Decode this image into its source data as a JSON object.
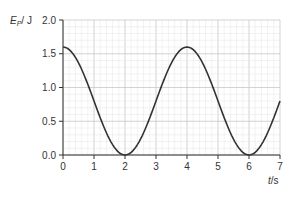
{
  "chart_data": {
    "type": "line",
    "title": "",
    "ylabel": "Ep/J",
    "ylabel_main": "E",
    "ylabel_sub": "P",
    "ylabel_unit": "/ J",
    "xlabel": "t/s",
    "xlabel_main": "t",
    "xlabel_unit": "/s",
    "xlim": [
      0,
      7
    ],
    "ylim": [
      0,
      2.0
    ],
    "grid": true,
    "x_ticks": [
      "0",
      "1",
      "2",
      "3",
      "4",
      "5",
      "6",
      "7"
    ],
    "y_ticks": [
      "0.0",
      "0.5",
      "1.0",
      "1.5",
      "2.0"
    ],
    "series": [
      {
        "name": "Ep",
        "color": "#333333",
        "x": [
          0,
          0.5,
          1,
          1.5,
          2,
          2.5,
          3,
          3.5,
          4,
          4.5,
          5,
          5.5,
          6,
          6.5,
          7
        ],
        "values": [
          1.6,
          1.37,
          0.8,
          0.23,
          0.0,
          0.23,
          0.8,
          1.37,
          1.6,
          1.37,
          0.8,
          0.23,
          0.0,
          0.23,
          0.8
        ]
      }
    ]
  }
}
